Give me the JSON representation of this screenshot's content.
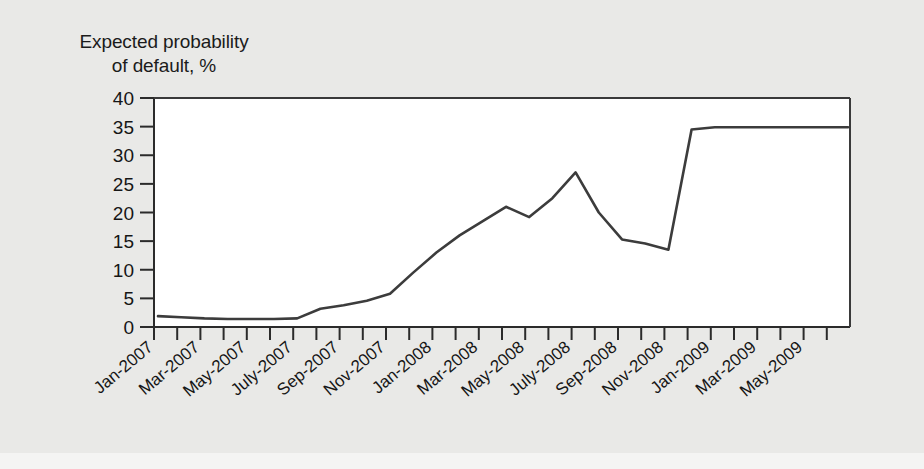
{
  "chart_data": {
    "type": "line",
    "title_line1": "Expected probability",
    "title_line2": "of default, %",
    "xlabel": "",
    "ylabel": "Expected probability of default, %",
    "ylim": [
      0,
      40
    ],
    "ytick_labels": [
      "0",
      "5",
      "10",
      "15",
      "20",
      "25",
      "30",
      "35",
      "40"
    ],
    "ytick_values": [
      0,
      5,
      10,
      15,
      20,
      25,
      30,
      35,
      40
    ],
    "grid": false,
    "legend": "none",
    "x": [
      "Jan-2007",
      "Feb-2007",
      "Mar-2007",
      "Apr-2007",
      "May-2007",
      "Jun-2007",
      "July-2007",
      "Aug-2007",
      "Sep-2007",
      "Oct-2007",
      "Nov-2007",
      "Dec-2007",
      "Jan-2008",
      "Feb-2008",
      "Mar-2008",
      "Apr-2008",
      "May-2008",
      "Jun-2008",
      "July-2008",
      "Aug-2008",
      "Sep-2008",
      "Oct-2008",
      "Nov-2008",
      "Dec-2008",
      "Jan-2009",
      "Feb-2009",
      "Mar-2009",
      "Apr-2009",
      "May-2009",
      "Jun-2009"
    ],
    "xtick_labels": [
      "Jan-2007",
      "Mar-2007",
      "May-2007",
      "July-2007",
      "Sep-2007",
      "Nov-2007",
      "Jan-2008",
      "Mar-2008",
      "May-2008",
      "July-2008",
      "Sep-2008",
      "Nov-2008",
      "Jan-2009",
      "Mar-2009",
      "May-2009"
    ],
    "values": [
      1.9,
      1.7,
      1.5,
      1.4,
      1.4,
      1.4,
      1.5,
      3.2,
      3.8,
      4.6,
      5.8,
      9.5,
      13.0,
      16.0,
      18.5,
      21.0,
      19.2,
      22.5,
      27.0,
      20.0,
      15.3,
      14.6,
      13.5,
      34.5,
      34.9,
      34.9,
      34.9,
      34.9,
      34.9,
      34.9
    ],
    "series_name": "Expected probability of default"
  },
  "colors": {
    "background": "#e9e9e7",
    "plot_background": "#ffffff",
    "line": "#3c3c3c",
    "axis": "#2b2b2b",
    "text": "#161616"
  }
}
